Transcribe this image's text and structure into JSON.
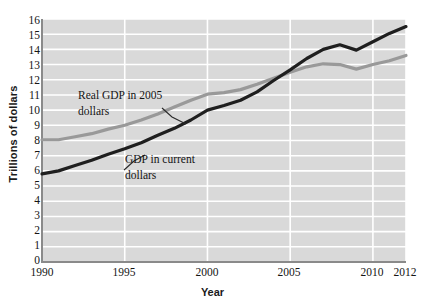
{
  "chart_data": {
    "type": "line",
    "title": "",
    "xlabel": "Year",
    "ylabel": "Trillions of dollars",
    "xlim": [
      1990,
      2012
    ],
    "ylim": [
      0,
      16
    ],
    "grid": true,
    "legend_position": "inline-annotations",
    "xticks": [
      "1990",
      "1995",
      "2000",
      "2005",
      "2010",
      "2012"
    ],
    "xtick_values": [
      1990,
      1995,
      2000,
      2005,
      2010,
      2012
    ],
    "yticks": [
      "0",
      "1",
      "2",
      "3",
      "4",
      "5",
      "6",
      "7",
      "8",
      "9",
      "10",
      "11",
      "12",
      "13",
      "14",
      "15",
      "16"
    ],
    "ytick_values": [
      0,
      1,
      2,
      3,
      4,
      5,
      6,
      7,
      8,
      9,
      10,
      11,
      12,
      13,
      14,
      15,
      16
    ],
    "x": [
      1990,
      1991,
      1992,
      1993,
      1994,
      1995,
      1996,
      1997,
      1998,
      1999,
      2000,
      2001,
      2002,
      2003,
      2004,
      2005,
      2006,
      2007,
      2008,
      2009,
      2010,
      2011,
      2012
    ],
    "series": [
      {
        "name": "Real GDP in 2005 dollars",
        "color": "#999999",
        "values": [
          8.05,
          8.05,
          8.25,
          8.45,
          8.75,
          9.0,
          9.35,
          9.75,
          10.2,
          10.65,
          11.05,
          11.15,
          11.35,
          11.7,
          12.1,
          12.5,
          12.85,
          13.05,
          13.0,
          12.7,
          13.0,
          13.25,
          13.6
        ]
      },
      {
        "name": "GDP in current dollars",
        "color": "#1f1f1f",
        "values": [
          5.8,
          6.0,
          6.35,
          6.7,
          7.1,
          7.45,
          7.85,
          8.35,
          8.8,
          9.35,
          10.0,
          10.3,
          10.65,
          11.2,
          11.95,
          12.65,
          13.4,
          14.0,
          14.3,
          13.95,
          14.5,
          15.05,
          15.5
        ]
      }
    ],
    "annotations": [
      {
        "id": "real",
        "line1": "Real GDP in 2005",
        "line2": "dollars",
        "target": "gray-line"
      },
      {
        "id": "current",
        "line1": "GDP in current",
        "line2": "dollars",
        "target": "black-line"
      }
    ],
    "colors": {
      "plot_background": "#d9d9d9",
      "gridline": "#ffffff",
      "axis": "#808080",
      "text": "#141414"
    }
  }
}
